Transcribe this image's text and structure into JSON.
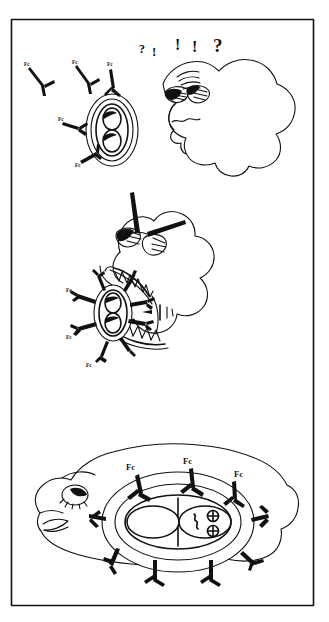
{
  "figure": {
    "medium": "hand-drawn line art",
    "border_color": "#333333",
    "ink_color": "#111111",
    "background_color": "#ffffff",
    "panel_count": 3
  },
  "panels": [
    {
      "id": "panel-1",
      "name": "confused-phagocyte-panel",
      "caption": "",
      "phagocyte": {
        "expression": "confused",
        "eyes": "two wide squinting eyes",
        "mouth": "wavy line"
      },
      "thought_marks": [
        {
          "glyph": "?",
          "size": "small"
        },
        {
          "glyph": "!",
          "size": "small"
        },
        {
          "glyph": "!",
          "size": "medium"
        },
        {
          "glyph": "!",
          "size": "medium"
        },
        {
          "glyph": "?",
          "size": "large"
        }
      ],
      "microbe": {
        "coated": false,
        "rings": 3,
        "inner_bodies": 2
      },
      "antibodies": [
        {
          "label": "Fc"
        },
        {
          "label": "Fc"
        },
        {
          "label": "Fc"
        },
        {
          "label": "Fc"
        },
        {
          "label": "Fc"
        }
      ]
    },
    {
      "id": "panel-2",
      "name": "engulfing-phagocyte-panel",
      "caption": "",
      "phagocyte": {
        "expression": "excited",
        "eyes": "two eyes with radiating action lines",
        "mouth": "wide open jagged-toothed mouth"
      },
      "microbe": {
        "coated": true,
        "rings": 2,
        "inner_bodies": 2
      },
      "antibodies": [
        {
          "label": "Fc"
        },
        {
          "label": "Fc"
        },
        {
          "label": "Fc"
        },
        {
          "label": "Fc"
        },
        {
          "label": "Fc"
        },
        {
          "label": "Fc"
        },
        {
          "label": "Fc"
        },
        {
          "label": "Fc"
        }
      ],
      "motion_marks": 3
    },
    {
      "id": "panel-3",
      "name": "digesting-phagocyte-panel",
      "caption": "",
      "phagocyte": {
        "expression": "satisfied",
        "eyes": "one closed lash eye",
        "mouth": "smiling lip"
      },
      "microbe": {
        "coated": true,
        "rings": 2,
        "inner_bodies": 2,
        "internal_contents": "squiggle and two circled-cross granules"
      },
      "antibodies": [
        {
          "label": "Fc"
        },
        {
          "label": "Fc"
        },
        {
          "label": "Fc"
        }
      ],
      "visible_labels": [
        "Fc",
        "Fc",
        "Fc"
      ]
    }
  ],
  "labels": {
    "fc": "Fc",
    "question": "?",
    "exclaim": "!"
  }
}
